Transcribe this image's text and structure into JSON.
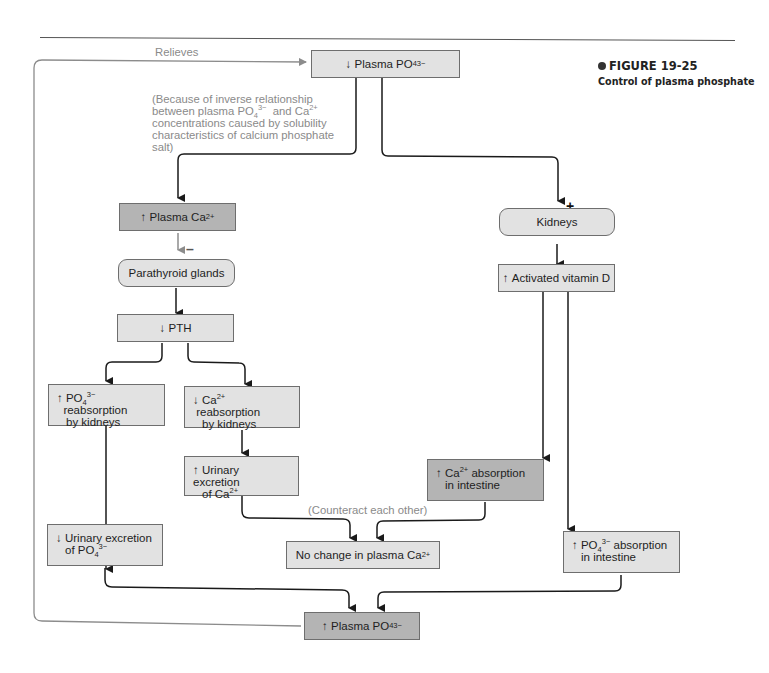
{
  "figure": {
    "number": "FIGURE 19-25",
    "caption": "Control of plasma phosphate"
  },
  "notes": {
    "relieves": "Relieves",
    "inverse_relationship_lines": [
      "(Because of inverse relationship",
      "between plasma PO4 3− and Ca2+",
      "concentrations caused by solubility",
      "characteristics of calcium phosphate",
      "salt)"
    ],
    "counteract": "(Counteract each other)"
  },
  "signs": {
    "plus": "+",
    "minus": "–"
  },
  "nodes": {
    "plasma_po4_decrease": {
      "arrow": "↓",
      "text": "Plasma PO",
      "sub": "4",
      "sup": "3−",
      "shade": "light"
    },
    "plasma_ca_increase": {
      "arrow": "↑",
      "text": "Plasma Ca",
      "sup": "2+",
      "shade": "dark"
    },
    "parathyroid_glands": {
      "text": "Parathyroid glands",
      "shade": "light"
    },
    "pth_decrease": {
      "arrow": "↓",
      "text": "PTH",
      "shade": "light"
    },
    "po4_reabsorption_increase": {
      "arrow": "↑",
      "line1_a": "PO",
      "line1_sub": "4",
      "line1_sup": "3−",
      "line1_b": "  reabsorption",
      "line2": "by kidneys",
      "shade": "light"
    },
    "ca_reabsorption_decrease": {
      "arrow": "↓",
      "line1_a": "Ca",
      "line1_sup": "2+",
      "line1_b": " reabsorption",
      "line2": "by kidneys",
      "shade": "light"
    },
    "urinary_ca_increase": {
      "arrow": "↑",
      "line1": "Urinary excretion",
      "line2_a": "of Ca",
      "line2_sup": "2+",
      "shade": "light"
    },
    "urinary_po4_decrease": {
      "arrow": "↓",
      "line1": "Urinary excretion",
      "line2_a": "of PO",
      "line2_sub": "4",
      "line2_sup": "3−",
      "shade": "light"
    },
    "no_change_ca": {
      "text": "No change in plasma Ca",
      "sup": "2+",
      "shade": "light"
    },
    "kidneys": {
      "text": "Kidneys",
      "shade": "light"
    },
    "activated_vit_d": {
      "arrow": "↑",
      "text": "Activated vitamin D",
      "shade": "light"
    },
    "ca_absorption_increase": {
      "arrow": "↑",
      "line1_a": "Ca",
      "line1_sup": "2+",
      "line1_b": " absorption",
      "line2": "in intestine",
      "shade": "dark"
    },
    "po4_absorption_increase": {
      "arrow": "↑",
      "line1_a": "PO",
      "line1_sub": "4",
      "line1_sup": "3−",
      "line1_b": " absorption",
      "line2": "in intestine",
      "shade": "light"
    },
    "plasma_po4_increase": {
      "arrow": "↑",
      "text": "Plasma PO",
      "sub": "4",
      "sup": "3−",
      "shade": "dark"
    }
  },
  "colors": {
    "light_box": "#e2e2e2",
    "dark_box": "#b4b4b4",
    "note_gray": "#8a8a8a",
    "line": "#1a1a1a",
    "feedback_line": "#8c8c8c"
  }
}
